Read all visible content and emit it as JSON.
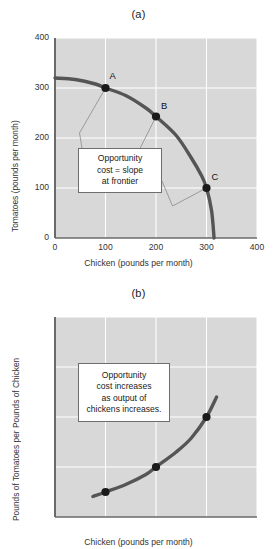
{
  "figure": {
    "panel_a_title": "(a)",
    "panel_b_title": "(b)"
  },
  "colors": {
    "plot_background": "#d8d8d8",
    "gridline": "#ffffff",
    "curve": "#555555",
    "axis": "#6a6a6a",
    "point": "#1a1a1a",
    "leader_line": "#8a8a8a",
    "callout_border": "#6e6e6e",
    "callout_fill": "#ffffff"
  },
  "chart_data": [
    {
      "type": "line",
      "id": "panel-a",
      "title": "(a)",
      "xlabel": "Chicken (pounds per month)",
      "ylabel": "Tomatoes (pounds per month)",
      "xlim": [
        0,
        400
      ],
      "ylim": [
        0,
        400
      ],
      "xticks": [
        0,
        100,
        200,
        300,
        400
      ],
      "yticks": [
        0,
        100,
        200,
        300,
        400
      ],
      "xtick_labels": [
        "0",
        "100",
        "200",
        "300",
        "400"
      ],
      "ytick_labels": [
        "0",
        "100",
        "200",
        "300",
        "400"
      ],
      "grid": true,
      "legend": "none",
      "series": [
        {
          "name": "Production possibilities frontier",
          "x": [
            0,
            40,
            80,
            100,
            140,
            180,
            200,
            240,
            270,
            290,
            300,
            310,
            315
          ],
          "y": [
            320,
            317,
            308,
            300,
            285,
            260,
            243,
            205,
            160,
            125,
            100,
            55,
            0
          ]
        }
      ],
      "points": [
        {
          "label": "A",
          "x": 100,
          "y": 300
        },
        {
          "label": "B",
          "x": 200,
          "y": 243
        },
        {
          "label": "C",
          "x": 300,
          "y": 100
        }
      ],
      "annotation": {
        "lines": [
          "Opportunity",
          "cost = slope",
          "at frontier"
        ],
        "text": "Opportunity cost = slope at frontier"
      }
    },
    {
      "type": "line",
      "id": "panel-b",
      "title": "(b)",
      "xlabel": "Chicken (pounds per month)",
      "ylabel": "Pounds of Tomatoes per Pounds of Chicken",
      "xlim": [
        0,
        400
      ],
      "ylim": [
        0,
        4
      ],
      "xticks": [
        0,
        100,
        200,
        300,
        400
      ],
      "yticks": [
        0,
        1,
        2,
        3,
        4
      ],
      "xtick_labels": [
        "0",
        "100",
        "200",
        "300",
        "400"
      ],
      "ytick_labels": [
        "0",
        "1",
        "2",
        "3",
        "4"
      ],
      "grid": true,
      "legend": "none",
      "series": [
        {
          "name": "Opportunity cost of chicken",
          "x": [
            75,
            100,
            140,
            180,
            200,
            240,
            270,
            300,
            320
          ],
          "y": [
            0.41,
            0.5,
            0.65,
            0.85,
            1.0,
            1.3,
            1.58,
            2.0,
            2.4
          ]
        }
      ],
      "points": [
        {
          "label": "a",
          "x": 100,
          "y": 0.5
        },
        {
          "label": "b",
          "x": 200,
          "y": 1.0
        },
        {
          "label": "c",
          "x": 300,
          "y": 2.0
        }
      ],
      "annotation": {
        "lines": [
          "Opportunity",
          "cost increases",
          "as output of",
          "chickens increases."
        ],
        "text": "Opportunity cost increases as output of chickens increases."
      }
    }
  ]
}
